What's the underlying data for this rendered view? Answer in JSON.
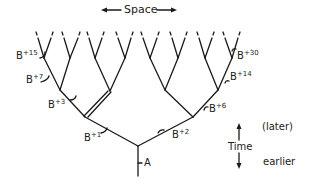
{
  "diagram": {
    "type": "branching-tree",
    "space_label": "Space",
    "time_label": "Time",
    "later_label": "(later)",
    "earlier_label": "earlier",
    "root_label": "A",
    "branch_labels": [
      {
        "id": "b1",
        "base": "B",
        "exp": "+1"
      },
      {
        "id": "b2",
        "base": "B",
        "exp": "+2"
      },
      {
        "id": "b3",
        "base": "B",
        "exp": "+3"
      },
      {
        "id": "b6",
        "base": "B",
        "exp": "+6"
      },
      {
        "id": "b7",
        "base": "B",
        "exp": "+7"
      },
      {
        "id": "b14",
        "base": "B",
        "exp": "+14"
      },
      {
        "id": "b15",
        "base": "B",
        "exp": "+15"
      },
      {
        "id": "b30",
        "base": "B",
        "exp": "+30"
      }
    ],
    "stroke_color": "#1a1a1a",
    "background": "#ffffff"
  }
}
